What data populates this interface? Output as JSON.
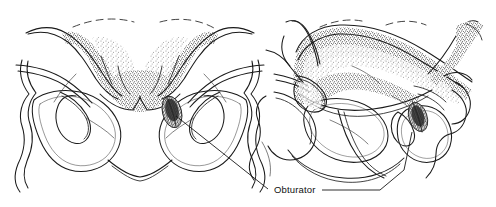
{
  "figure": {
    "kind": "anatomical-line-drawing",
    "style": "stipple pen-and-ink",
    "background_color": "#ffffff",
    "ink_color": "#1a1a1a",
    "panels": [
      {
        "id": "left-panel",
        "view": "anteroposterior",
        "description": "Pelvis AP view with symmetric obturator foramina"
      },
      {
        "id": "right-panel",
        "view": "oblique",
        "description": "Pelvis rotated oblique view with foreshortened obturator foramina"
      }
    ],
    "annotations": [
      {
        "id": "obturator",
        "label": "Obturator",
        "color": "#101010",
        "leader_count": 2
      }
    ]
  },
  "labels": {
    "obturator": "Obturator"
  },
  "colors": {
    "background": "#ffffff",
    "ink": "#1a1a1a",
    "leader": "#171717",
    "stipple_dark": "#2b2b2b",
    "stipple_light": "#6e6e6e"
  }
}
